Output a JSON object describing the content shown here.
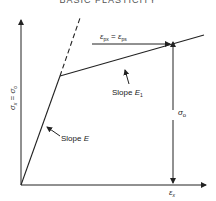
{
  "header": {
    "title": "BASIC PLASTICITY"
  },
  "diagram": {
    "y_axis_label": "σx = σ0",
    "x_axis_label": "εx",
    "labels": {
      "slope_elastic": "Slope E",
      "slope_plastic": "Slope E1",
      "strain_equiv": "εpx = εps",
      "stress": "σ0"
    },
    "colors": {
      "line": "#222222",
      "background": "#ffffff"
    }
  }
}
